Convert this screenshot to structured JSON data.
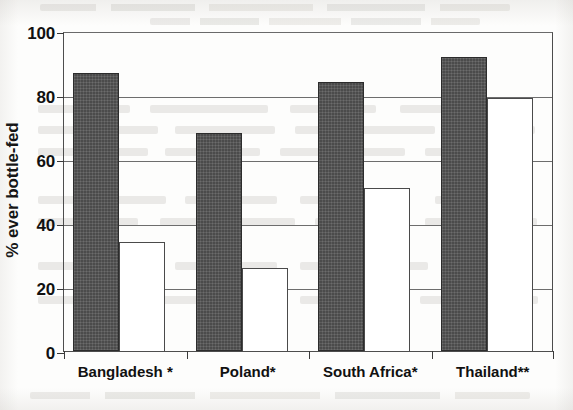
{
  "chart_data": {
    "type": "bar",
    "title": "",
    "xlabel": "",
    "ylabel": "% ever bottle-fed",
    "ylim": [
      0,
      100
    ],
    "yticks": [
      0,
      20,
      40,
      60,
      80,
      100
    ],
    "ytick_labels": [
      "0",
      "20",
      "40",
      "60",
      "80",
      "100"
    ],
    "grid": "horizontal",
    "legend": "none",
    "categories": [
      "Bangladesh *",
      "Poland*",
      "South Africa*",
      "Thailand**"
    ],
    "series": [
      {
        "name": "dark-filled-series",
        "style": "filled",
        "color": "#4b4b4b",
        "values": [
          87,
          68,
          84,
          92
        ]
      },
      {
        "name": "white-hollow-series",
        "style": "hollow",
        "color": "#ffffff",
        "values": [
          34,
          26,
          51,
          79
        ]
      }
    ]
  },
  "axis": {
    "y_title": "% ever bottle-fed"
  },
  "colors": {
    "filled_bar": "#4b4b4b",
    "hollow_bar": "#ffffff",
    "axis": "#3a3a3a",
    "gridline": "#6d6d6d",
    "text": "#111111",
    "page": "#fdfdfc"
  }
}
